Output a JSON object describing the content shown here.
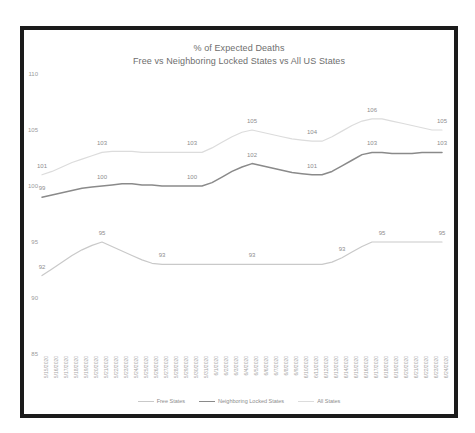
{
  "chart_data": {
    "type": "line",
    "title": "% of Expected Deaths",
    "subtitle": "Free vs Neighboring Locked States vs All US States",
    "xlabel": "",
    "ylabel": "",
    "ylim": [
      85,
      110
    ],
    "yticks": [
      85,
      90,
      95,
      100,
      105,
      110
    ],
    "grid": false,
    "legend_position": "bottom",
    "x": [
      "5/15/2020",
      "5/16/2020",
      "5/17/2020",
      "5/18/2020",
      "5/19/2020",
      "5/20/2020",
      "5/21/2020",
      "5/22/2020",
      "5/23/2020",
      "5/24/2020",
      "5/25/2020",
      "5/26/2020",
      "5/27/2020",
      "5/28/2020",
      "5/29/2020",
      "5/30/2020",
      "5/31/2020",
      "6/1/2020",
      "6/2/2020",
      "6/3/2020",
      "6/4/2020",
      "6/5/2020",
      "6/6/2020",
      "6/7/2020",
      "6/8/2020",
      "6/9/2020",
      "6/10/2020",
      "6/11/2020",
      "6/12/2020",
      "6/13/2020",
      "6/14/2020",
      "6/15/2020",
      "6/16/2020",
      "6/17/2020",
      "6/18/2020",
      "6/19/2020",
      "6/20/2020",
      "6/21/2020",
      "6/22/2020",
      "6/23/2020",
      "6/24/2020"
    ],
    "series": [
      {
        "name": "Free States",
        "color": "#c9c9c9",
        "width": 1.2,
        "values": [
          92.0,
          92.6,
          93.2,
          93.8,
          94.3,
          94.7,
          95.0,
          94.6,
          94.2,
          93.8,
          93.4,
          93.1,
          93.0,
          93.0,
          93.0,
          93.0,
          93.0,
          93.0,
          93.0,
          93.0,
          93.0,
          93.0,
          93.0,
          93.0,
          93.0,
          93.0,
          93.0,
          93.0,
          93.0,
          93.2,
          93.6,
          94.1,
          94.6,
          95.0,
          95.0,
          95.0,
          95.0,
          95.0,
          95.0,
          95.0,
          95.0
        ],
        "point_labels": [
          {
            "index": 0,
            "value": 92,
            "dy": -6
          },
          {
            "index": 6,
            "value": 95,
            "dy": -6
          },
          {
            "index": 12,
            "value": 93,
            "dy": -6
          },
          {
            "index": 21,
            "value": 93,
            "dy": -6
          },
          {
            "index": 30,
            "value": 93,
            "dy": -6
          },
          {
            "index": 34,
            "value": 95,
            "dy": -6
          },
          {
            "index": 40,
            "value": 95,
            "dy": -6
          }
        ]
      },
      {
        "name": "Neighboring Locked States",
        "color": "#8a8a8a",
        "width": 1.5,
        "values": [
          99.0,
          99.2,
          99.4,
          99.6,
          99.8,
          99.9,
          100.0,
          100.1,
          100.2,
          100.2,
          100.1,
          100.1,
          100.0,
          100.0,
          100.0,
          100.0,
          100.0,
          100.3,
          100.8,
          101.3,
          101.7,
          102.0,
          101.8,
          101.6,
          101.4,
          101.2,
          101.1,
          101.0,
          101.0,
          101.3,
          101.8,
          102.3,
          102.8,
          103.0,
          103.0,
          102.9,
          102.9,
          102.9,
          103.0,
          103.0,
          103.0
        ],
        "point_labels": [
          {
            "index": 0,
            "value": 99,
            "dy": -6
          },
          {
            "index": 6,
            "value": 100,
            "dy": -6
          },
          {
            "index": 15,
            "value": 100,
            "dy": -6
          },
          {
            "index": 21,
            "value": 102,
            "dy": -6
          },
          {
            "index": 27,
            "value": 101,
            "dy": -6
          },
          {
            "index": 33,
            "value": 103,
            "dy": -6
          },
          {
            "index": 40,
            "value": 103,
            "dy": -6
          }
        ]
      },
      {
        "name": "All States",
        "color": "#dcdcdc",
        "width": 1.2,
        "values": [
          101.0,
          101.3,
          101.7,
          102.1,
          102.4,
          102.7,
          103.0,
          103.1,
          103.1,
          103.1,
          103.0,
          103.0,
          103.0,
          103.0,
          103.0,
          103.0,
          103.0,
          103.4,
          103.9,
          104.4,
          104.8,
          105.0,
          104.8,
          104.6,
          104.4,
          104.2,
          104.1,
          104.0,
          104.0,
          104.4,
          104.9,
          105.4,
          105.8,
          106.0,
          106.0,
          105.8,
          105.6,
          105.4,
          105.2,
          105.0,
          105.0
        ],
        "point_labels": [
          {
            "index": 0,
            "value": 101,
            "dy": -6
          },
          {
            "index": 6,
            "value": 103,
            "dy": -6
          },
          {
            "index": 15,
            "value": 103,
            "dy": -6
          },
          {
            "index": 21,
            "value": 105,
            "dy": -6
          },
          {
            "index": 27,
            "value": 104,
            "dy": -6
          },
          {
            "index": 33,
            "value": 106,
            "dy": -6
          },
          {
            "index": 40,
            "value": 105,
            "dy": -6
          }
        ]
      }
    ]
  }
}
